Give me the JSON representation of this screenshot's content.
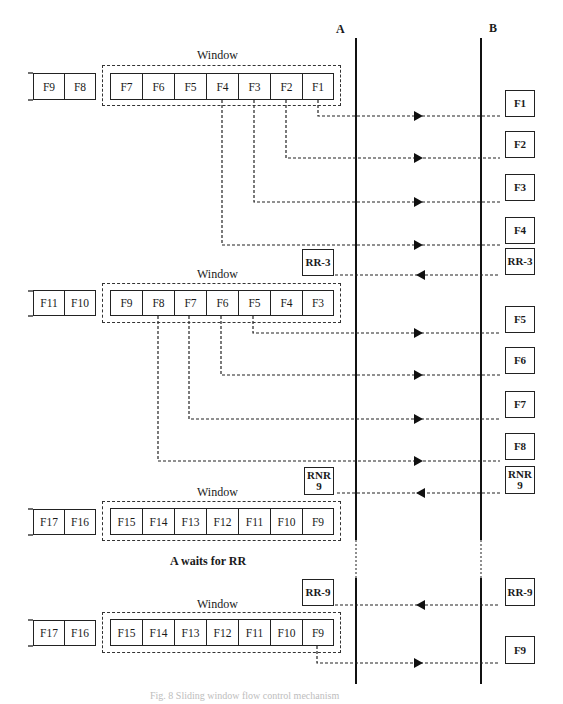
{
  "stations": {
    "a": {
      "label": "A",
      "x": 356
    },
    "b": {
      "label": "B",
      "x": 481
    }
  },
  "window_label": "Window",
  "blocks": [
    {
      "queued": [
        "F9",
        "F8"
      ],
      "window": [
        "F7",
        "F6",
        "F5",
        "F4",
        "F3",
        "F2",
        "F1"
      ],
      "top": 65
    },
    {
      "queued": [
        "F11",
        "F10"
      ],
      "window": [
        "F9",
        "F8",
        "F7",
        "F6",
        "F5",
        "F4",
        "F3"
      ],
      "top": 283
    },
    {
      "queued": [
        "F17",
        "F16"
      ],
      "window": [
        "F15",
        "F14",
        "F13",
        "F12",
        "F11",
        "F10",
        "F9"
      ],
      "top": 501
    },
    {
      "queued": [
        "F17",
        "F16"
      ],
      "window": [
        "F15",
        "F14",
        "F13",
        "F12",
        "F11",
        "F10",
        "F9"
      ],
      "top": 612
    }
  ],
  "messages": [
    {
      "label": "F1",
      "direction": "A->B",
      "y": 116
    },
    {
      "label": "F2",
      "direction": "A->B",
      "y": 158
    },
    {
      "label": "F3",
      "direction": "A->B",
      "y": 202
    },
    {
      "label": "F4",
      "direction": "A->B",
      "y": 245
    },
    {
      "label": "RR-3",
      "direction": "B->A",
      "y": 275
    },
    {
      "label": "F5",
      "direction": "A->B",
      "y": 333
    },
    {
      "label": "F6",
      "direction": "A->B",
      "y": 375
    },
    {
      "label": "F7",
      "direction": "A->B",
      "y": 419
    },
    {
      "label": "F8",
      "direction": "A->B",
      "y": 461
    },
    {
      "label": "RNR 9",
      "line1": "RNR",
      "line2": "9",
      "direction": "B->A",
      "y": 493
    },
    {
      "label": "RR-9",
      "direction": "B->A",
      "y": 605
    },
    {
      "label": "F9",
      "direction": "A->B",
      "y": 663
    }
  ],
  "annotations": {
    "wait_note": "A waits for RR",
    "caption": "Fig. 8  Sliding window flow control mechanism"
  },
  "labels": {
    "ack1": "RR-3",
    "ack2_line1": "RNR",
    "ack2_line2": "9",
    "ack3": "RR-9"
  }
}
